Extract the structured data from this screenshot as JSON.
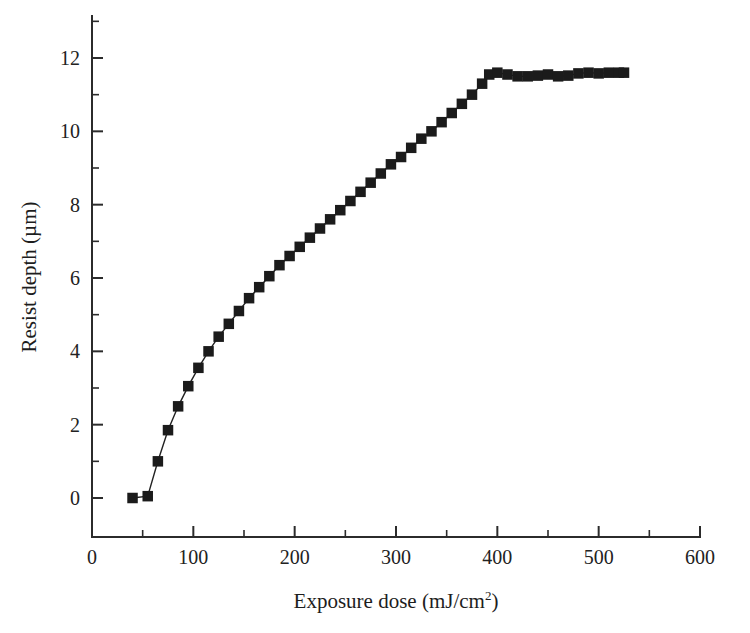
{
  "figure": {
    "background_color": "#ffffff",
    "foreground_color": "#222222",
    "marker_color": "#1b1b1b",
    "title": "",
    "frame": "left-and-bottom-axes"
  },
  "axes": {
    "x": {
      "label_text": "Exposure dose (mJ/cm",
      "label_superscript": "2",
      "label_suffix": ")",
      "label_full": "Exposure dose (mJ/cm2)",
      "min": 0,
      "max": 600,
      "major_ticks": [
        0,
        100,
        200,
        300,
        400,
        500,
        600
      ],
      "minor_ticks": [
        50,
        150,
        250,
        350,
        450,
        550
      ],
      "tick_labels": [
        "0",
        "100",
        "200",
        "300",
        "400",
        "500",
        "600"
      ],
      "tick_direction": "out-up"
    },
    "y": {
      "label_text": "Resist depth (µm)",
      "min": -1.1,
      "max": 13.2,
      "major_ticks": [
        0,
        2,
        4,
        6,
        8,
        10,
        12
      ],
      "minor_ticks": [
        1,
        3,
        5,
        7,
        9,
        11,
        13
      ],
      "tick_labels": [
        "0",
        "2",
        "4",
        "6",
        "8",
        "10",
        "12"
      ],
      "tick_direction": "out-right"
    }
  },
  "chart_data": {
    "type": "scatter",
    "title": "",
    "xlabel": "Exposure dose (mJ/cm2)",
    "ylabel": "Resist depth (µm)",
    "xlim": [
      0,
      600
    ],
    "ylim": [
      -1.1,
      13.2
    ],
    "grid": false,
    "legend": null,
    "marker_style": "filled-square",
    "line_style": "solid-connector",
    "series": [
      {
        "name": "Resist depth vs exposure dose",
        "x": [
          40,
          55,
          65,
          75,
          85,
          95,
          105,
          115,
          125,
          135,
          145,
          155,
          165,
          175,
          185,
          195,
          205,
          215,
          225,
          235,
          245,
          255,
          265,
          275,
          285,
          295,
          305,
          315,
          325,
          335,
          345,
          355,
          365,
          375,
          385,
          392,
          400,
          410,
          420,
          430,
          440,
          450,
          460,
          470,
          480,
          490,
          500,
          510,
          520,
          525
        ],
        "y": [
          0.0,
          0.05,
          1.0,
          1.85,
          2.5,
          3.05,
          3.55,
          4.0,
          4.4,
          4.75,
          5.1,
          5.45,
          5.75,
          6.05,
          6.35,
          6.6,
          6.85,
          7.1,
          7.35,
          7.6,
          7.85,
          8.1,
          8.35,
          8.6,
          8.85,
          9.1,
          9.3,
          9.55,
          9.8,
          10.0,
          10.25,
          10.5,
          10.75,
          11.0,
          11.3,
          11.55,
          11.6,
          11.55,
          11.5,
          11.5,
          11.52,
          11.55,
          11.5,
          11.52,
          11.58,
          11.6,
          11.58,
          11.6,
          11.6,
          11.6
        ]
      }
    ],
    "notes": {
      "threshold_dose": 40,
      "saturation_dose": 392,
      "saturation_depth": 11.6
    }
  }
}
